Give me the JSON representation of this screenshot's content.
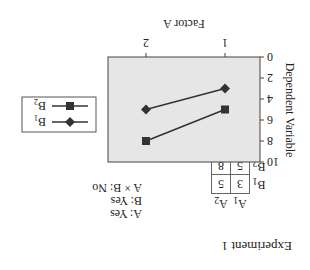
{
  "experiment_title": "Experiment 1",
  "table": {
    "col_headers": [
      "A1",
      "A2"
    ],
    "rows": [
      {
        "label": "B1",
        "values": [
          "3",
          "5"
        ]
      },
      {
        "label": "B2",
        "values": [
          "5",
          "8"
        ]
      }
    ]
  },
  "effects": [
    "A: Yes",
    "B: Yes",
    "A × B: No"
  ],
  "chart_data": {
    "type": "line",
    "title": "",
    "xlabel": "Factor A",
    "ylabel": "Dependent Variable",
    "categories": [
      "1",
      "2"
    ],
    "yticks": [
      "0",
      "2",
      "4",
      "6",
      "8",
      "10"
    ],
    "ylim": [
      0,
      10
    ],
    "y_inverted_view": true,
    "series": [
      {
        "name": "B1",
        "marker": "diamond",
        "values": [
          3,
          5
        ]
      },
      {
        "name": "B2",
        "marker": "square",
        "values": [
          5,
          8
        ]
      }
    ],
    "legend": [
      "B1",
      "B2"
    ],
    "plot_bg": "#e6e6e6",
    "line_color": "#333333"
  }
}
